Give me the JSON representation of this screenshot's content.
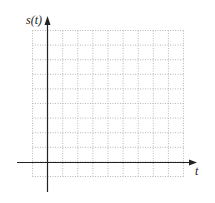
{
  "diagram": {
    "y_axis_label": "s(t)",
    "x_axis_label": "t",
    "grid": {
      "columns": 10,
      "rows": 10,
      "style": "dotted",
      "color": "#b0b0b0"
    },
    "axis_color": "#222222"
  }
}
